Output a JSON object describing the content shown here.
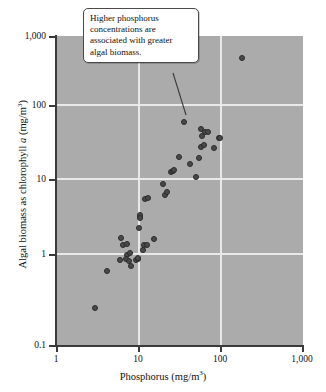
{
  "chart_data": {
    "type": "scatter",
    "title": "",
    "xlabel": "Phosphorus (mg/m3)",
    "ylabel": "Algal biomass as chlorophyll a (mg/m3)",
    "xscale": "log",
    "yscale": "log",
    "xlim": [
      1,
      1000
    ],
    "ylim": [
      0.1,
      1000
    ],
    "grid": true,
    "legend": null,
    "xticks": [
      "1",
      "10",
      "100",
      "1,000"
    ],
    "xtick_values": [
      1,
      10,
      100,
      1000
    ],
    "yticks": [
      "0.1",
      "1",
      "10",
      "100",
      "1,000"
    ],
    "ytick_values": [
      0.1,
      1,
      10,
      100,
      1000
    ],
    "annotations": [
      {
        "text": "Higher phosphorus concentrations are associated with greater algal biomass.",
        "lines": [
          "Higher phosphorus",
          "concentrations are",
          "associated with greater",
          "algal biomass."
        ],
        "points_to_x": 36,
        "points_to_y": 78
      }
    ],
    "series": [
      {
        "name": "Lakes",
        "marker": "circle",
        "color": "#4a4a4a",
        "points": [
          [
            3.0,
            0.3
          ],
          [
            4.2,
            0.9
          ],
          [
            6.0,
            1.25
          ],
          [
            6.2,
            2.45
          ],
          [
            6.6,
            1.95
          ],
          [
            7.2,
            2.05
          ],
          [
            7.3,
            1.45
          ],
          [
            7.0,
            1.3
          ],
          [
            7.6,
            1.22
          ],
          [
            8.0,
            1.55
          ],
          [
            8.2,
            1.05
          ],
          [
            9.4,
            1.25
          ],
          [
            9.8,
            1.3
          ],
          [
            10.0,
            1.35
          ],
          [
            10.2,
            3.25
          ],
          [
            10.4,
            4.6
          ],
          [
            10.5,
            4.8
          ],
          [
            10.6,
            4.45
          ],
          [
            11.5,
            1.7
          ],
          [
            11.8,
            1.95
          ],
          [
            12.0,
            7.7
          ],
          [
            12.6,
            2.0
          ],
          [
            13.0,
            8.0
          ],
          [
            15.5,
            2.35
          ],
          [
            20.0,
            12.0
          ],
          [
            21.0,
            8.8
          ],
          [
            22.0,
            9.6
          ],
          [
            25.0,
            17.5
          ],
          [
            26.0,
            18.0
          ],
          [
            27.0,
            18.5
          ],
          [
            31.0,
            27.0
          ],
          [
            36.0,
            78.0
          ],
          [
            42.0,
            22.0
          ],
          [
            50.0,
            15.0
          ],
          [
            55.0,
            26.0
          ],
          [
            57.0,
            62.0
          ],
          [
            58.0,
            37.0
          ],
          [
            60.0,
            51.0
          ],
          [
            62.0,
            39.0
          ],
          [
            65.0,
            58.0
          ],
          [
            70.0,
            57.0
          ],
          [
            82.0,
            35.0
          ],
          [
            95.0,
            48.0
          ],
          [
            99.0,
            48.0
          ],
          [
            180.0,
            520.0
          ]
        ]
      }
    ]
  },
  "axes": {
    "x_title_main": "Phosphorus (mg/m",
    "x_title_sup": "3",
    "x_title_tail": ")",
    "y_title_pre": "Algal biomass as chlorophyll ",
    "y_title_italic": "a",
    "y_title_mid": " (mg/m",
    "y_title_sup": "3",
    "y_title_tail": ")"
  },
  "colors": {
    "plot_background": "#ababab",
    "gridline": "#e9e9e9",
    "marker_fill": "#4a4a4a",
    "marker_edge": "#2b2b2b",
    "axis": "#3a3a3a",
    "callout_border": "#4a4a4a",
    "page_background": "#ffffff"
  }
}
